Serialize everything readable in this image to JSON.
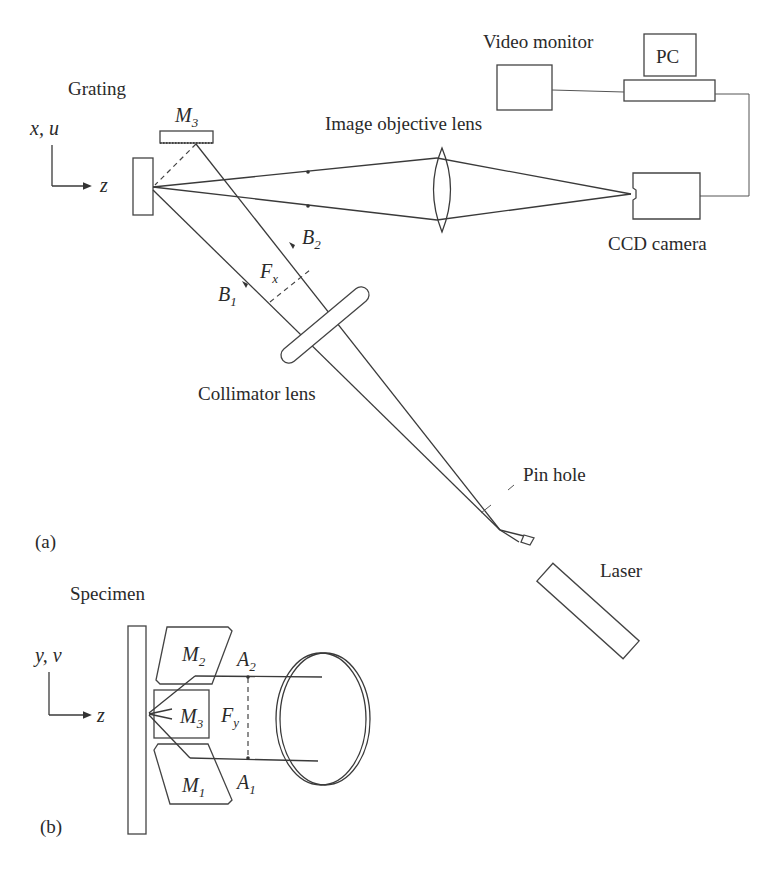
{
  "figure": {
    "panel_a": {
      "label": "(a)",
      "axis": {
        "vertical": "x, u",
        "horizontal": "z"
      },
      "components": {
        "grating": "Grating",
        "mirror_m3": {
          "letter": "M",
          "sub": "3"
        },
        "image_objective_lens": "Image objective lens",
        "video_monitor": "Video monitor",
        "pc": "PC",
        "ccd_camera": "CCD camera",
        "collimator_lens": "Collimator lens",
        "pin_hole": "Pin hole",
        "laser": "Laser"
      },
      "beams": {
        "b1": {
          "letter": "B",
          "sub": "1"
        },
        "b2": {
          "letter": "B",
          "sub": "2"
        },
        "fx": {
          "letter": "F",
          "sub": "x"
        }
      }
    },
    "panel_b": {
      "label": "(b)",
      "axis": {
        "vertical": "y, v",
        "horizontal": "z"
      },
      "components": {
        "specimen": "Specimen",
        "m1": {
          "letter": "M",
          "sub": "1"
        },
        "m2": {
          "letter": "M",
          "sub": "2"
        },
        "m3": {
          "letter": "M",
          "sub": "3"
        }
      },
      "beams": {
        "a1": {
          "letter": "A",
          "sub": "1"
        },
        "a2": {
          "letter": "A",
          "sub": "2"
        },
        "fy": {
          "letter": "F",
          "sub": "y"
        }
      }
    }
  }
}
